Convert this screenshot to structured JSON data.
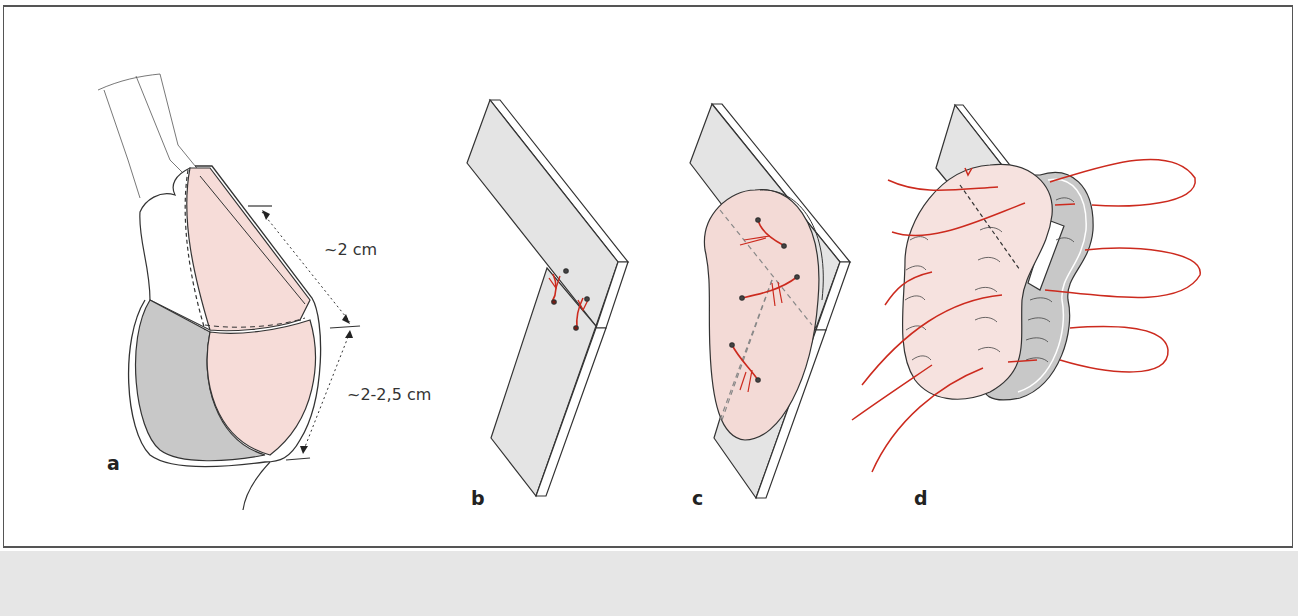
{
  "figure": {
    "panels": [
      {
        "id": "a",
        "label": "a"
      },
      {
        "id": "b",
        "label": "b"
      },
      {
        "id": "c",
        "label": "c"
      },
      {
        "id": "d",
        "label": "d"
      }
    ],
    "dimensions": {
      "upper": "~2 cm",
      "lower": "~2-2,5 cm"
    },
    "colors": {
      "pink_flap": "#f6dcd8",
      "gray_flap": "#c8c8c8",
      "plate": "#e4e4e4",
      "suture": "#cc2a1e",
      "outline": "#333333",
      "footer_band": "#e6e6e6"
    }
  }
}
